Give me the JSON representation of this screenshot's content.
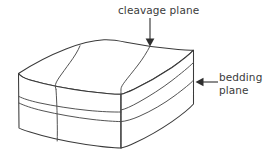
{
  "figure": {
    "background_color": "#ffffff",
    "line_color": "#3a3a3a",
    "text_color": "#3b3b3b"
  },
  "labels": {
    "cleavage": {
      "text": "cleavage plane",
      "position": "top-center"
    },
    "bedding": {
      "line1": "bedding",
      "line2": "plane",
      "position": "right-middle"
    }
  },
  "annotations": [
    {
      "name": "cleavage-arrow",
      "points_to": "top face cleavage trace",
      "direction": "down"
    },
    {
      "name": "bedding-arrow",
      "points_to": "right side bedding layer boundary",
      "direction": "left"
    }
  ],
  "block": {
    "type": "rectangular rock block",
    "faces": [
      "top",
      "left-front",
      "right-front"
    ],
    "cleavage_planes": 2,
    "bedding_planes": 2
  }
}
